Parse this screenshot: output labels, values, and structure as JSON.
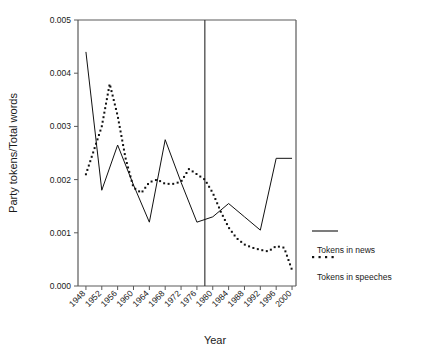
{
  "chart_data": {
    "type": "line",
    "title": "",
    "xlabel": "Year",
    "ylabel": "Party tokens/Total words",
    "xlim": [
      1946,
      2001
    ],
    "ylim": [
      0.0,
      0.005
    ],
    "grid": false,
    "legend_position": "right",
    "y_ticks": [
      "0.000",
      "0.001",
      "0.002",
      "0.003",
      "0.004",
      "0.005"
    ],
    "y_tick_values": [
      0.0,
      0.001,
      0.002,
      0.003,
      0.004,
      0.005
    ],
    "x_ticks": [
      "1948",
      "1952",
      "1956",
      "1960",
      "1964",
      "1968",
      "1972",
      "1976",
      "1980",
      "1984",
      "1988",
      "1992",
      "1996",
      "2000"
    ],
    "x_tick_values": [
      1948,
      1952,
      1956,
      1960,
      1964,
      1968,
      1972,
      1976,
      1980,
      1984,
      1988,
      1992,
      1996,
      2000
    ],
    "annotations": [
      {
        "name": "vertical-divider",
        "x": 1978,
        "label": ""
      }
    ],
    "series": [
      {
        "name": "Tokens in news",
        "style": "solid",
        "color": "#111111",
        "x": [
          1948,
          1952,
          1956,
          1960,
          1964,
          1968,
          1972,
          1976,
          1980,
          1984,
          1988,
          1992,
          1996,
          2000
        ],
        "values": [
          0.0044,
          0.0018,
          0.00265,
          0.0019,
          0.0012,
          0.00275,
          0.00195,
          0.0012,
          0.0013,
          0.00155,
          0.0013,
          0.00105,
          0.0024,
          0.0024
        ]
      },
      {
        "name": "Tokens in speeches",
        "style": "dotted",
        "color": "#111111",
        "x": [
          1948,
          1950,
          1952,
          1954,
          1956,
          1958,
          1960,
          1962,
          1964,
          1966,
          1968,
          1970,
          1972,
          1974,
          1976,
          1978,
          1980,
          1982,
          1984,
          1986,
          1988,
          1990,
          1992,
          1994,
          1996,
          1998,
          2000
        ],
        "values": [
          0.0021,
          0.00255,
          0.003,
          0.0038,
          0.0032,
          0.0024,
          0.00185,
          0.00175,
          0.00195,
          0.002,
          0.00192,
          0.00192,
          0.00196,
          0.0022,
          0.0021,
          0.002,
          0.00175,
          0.0014,
          0.0011,
          0.0009,
          0.00078,
          0.00072,
          0.00068,
          0.00065,
          0.00075,
          0.00072,
          0.0003
        ]
      }
    ]
  },
  "legend": {
    "items": [
      {
        "label": "Tokens in news",
        "style": "solid"
      },
      {
        "label": "Tokens in speeches",
        "style": "dotted"
      }
    ]
  },
  "axes": {
    "y_title": "Party tokens/Total words",
    "x_title": "Year"
  }
}
